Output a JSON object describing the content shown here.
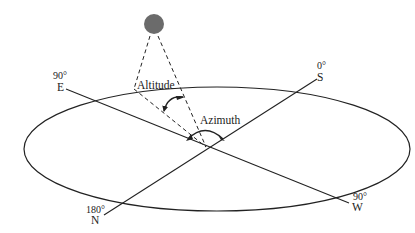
{
  "diagram": {
    "title": "",
    "labels": {
      "altitude": "Altitude",
      "azimuth": "Azimuth"
    },
    "directions": {
      "east": {
        "degree": "90°",
        "letter": "E"
      },
      "south": {
        "degree": "0°",
        "letter": "S"
      },
      "north": {
        "degree": "180°",
        "letter": "N"
      },
      "west": {
        "degree": "90°",
        "letter": "W"
      }
    },
    "sun": {
      "label": "",
      "color": "#6b6b6b"
    },
    "colors": {
      "line": "#222222",
      "sun_fill": "#6b6b6b",
      "background": "#ffffff"
    }
  }
}
